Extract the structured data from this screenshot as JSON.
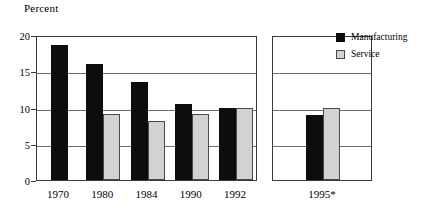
{
  "chart_data": {
    "type": "bar",
    "title": "",
    "ylabel": "Percent",
    "xlabel": "",
    "ylim": [
      0,
      20
    ],
    "yticks": [
      0,
      5,
      10,
      15,
      20
    ],
    "ytick_labels": [
      "0",
      "5",
      "10",
      "15",
      "20"
    ],
    "grid": true,
    "grid_axis": "y",
    "legend_position": "top-right",
    "categories": [
      "1970",
      "1980",
      "1984",
      "1990",
      "1992",
      "1995*"
    ],
    "series": [
      {
        "name": "Manufacturing",
        "color": "#0d0d0d",
        "values": [
          18.6,
          16.0,
          13.5,
          10.5,
          10.0,
          8.9
        ]
      },
      {
        "name": "Service",
        "color": "#d2d2d2",
        "values": [
          null,
          9.1,
          8.1,
          9.1,
          10.0,
          10.0
        ]
      }
    ],
    "panels": [
      {
        "name": "historical",
        "categories": [
          "1970",
          "1980",
          "1984",
          "1990",
          "1992"
        ]
      },
      {
        "name": "forecast",
        "categories": [
          "1995*"
        ]
      }
    ]
  },
  "legend": {
    "items": [
      {
        "label": "Manufacturing",
        "swatch": "manufacturing"
      },
      {
        "label": "Service",
        "swatch": "service"
      }
    ]
  }
}
